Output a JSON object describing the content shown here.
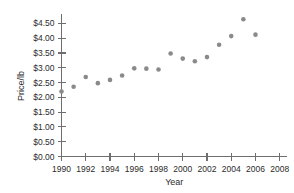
{
  "chart_data": {
    "type": "scatter",
    "title": "",
    "xlabel": "Year",
    "ylabel": "Price/lb",
    "x": [
      1990,
      1991,
      1992,
      1993,
      1994,
      1995,
      1996,
      1997,
      1998,
      1999,
      2000,
      2001,
      2002,
      2003,
      2004,
      2005,
      2006
    ],
    "values": [
      2.2,
      2.36,
      2.69,
      2.48,
      2.59,
      2.74,
      2.98,
      2.97,
      2.94,
      3.48,
      3.31,
      3.22,
      3.36,
      3.78,
      4.07,
      4.64,
      4.12
    ],
    "xlim": [
      1990,
      2008.6
    ],
    "ylim": [
      0,
      4.75
    ],
    "x_tick_values": [
      1990,
      1992,
      1994,
      1996,
      1998,
      2000,
      2002,
      2004,
      2006,
      2008
    ],
    "x_tick_labels": [
      "1990",
      "1992",
      "1994",
      "1996",
      "1998",
      "2000",
      "2002",
      "2004",
      "2006",
      "2008"
    ],
    "y_tick_values": [
      0.0,
      0.5,
      1.0,
      1.5,
      2.0,
      2.5,
      3.0,
      3.5,
      4.0,
      4.5
    ],
    "y_tick_labels": [
      "$0.00",
      "$0.50",
      "$1.00",
      "$1.50",
      "$2.00",
      "$2.50",
      "$3.00",
      "$3.50",
      "$4.00",
      "$4.50"
    ],
    "grid": false,
    "legend": "none",
    "marker_color": "#8a8a8a",
    "axis_color": "#6e6e6e",
    "text_color": "#2b2b2b"
  }
}
